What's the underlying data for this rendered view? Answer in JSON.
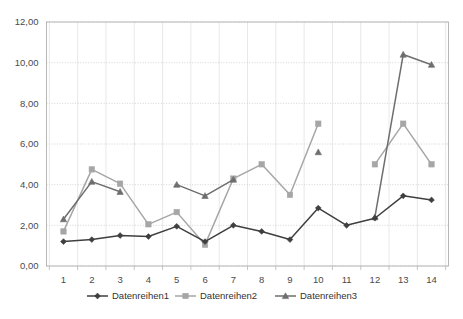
{
  "chart_data": {
    "type": "line",
    "title": "",
    "subtitle": "",
    "xlabel": "",
    "ylabel": "",
    "categories": [
      "1",
      "2",
      "3",
      "4",
      "5",
      "6",
      "7",
      "8",
      "9",
      "10",
      "11",
      "12",
      "13",
      "14"
    ],
    "ylim": [
      0.0,
      12.0
    ],
    "ytick_labels": [
      "0,00",
      "2,00",
      "4,00",
      "6,00",
      "8,00",
      "10,00",
      "12,00"
    ],
    "ytick_values": [
      0.0,
      2.0,
      4.0,
      6.0,
      8.0,
      10.0,
      12.0
    ],
    "grid": true,
    "legend_position": "bottom",
    "series": [
      {
        "name": "Datenreihen1",
        "color": "#3f3f3f",
        "marker": "diamond",
        "values": [
          1.2,
          1.3,
          1.5,
          1.45,
          1.95,
          1.2,
          2.0,
          1.7,
          1.3,
          2.85,
          2.0,
          2.35,
          3.45,
          3.25
        ]
      },
      {
        "name": "Datenreihen2",
        "color": "#a6a6a6",
        "marker": "square",
        "values": [
          1.7,
          4.75,
          4.05,
          2.05,
          2.65,
          1.05,
          4.3,
          5.0,
          3.5,
          7.0,
          null,
          5.0,
          7.0,
          5.0
        ]
      },
      {
        "name": "Datenreihen3",
        "color": "#6e6e6e",
        "marker": "triangle",
        "values": [
          2.3,
          4.15,
          3.65,
          null,
          4.0,
          3.45,
          4.25,
          null,
          null,
          5.6,
          null,
          2.4,
          10.4,
          9.9
        ]
      }
    ]
  },
  "legend": {
    "items": [
      {
        "label": "Datenreihen1",
        "color": "#3f3f3f",
        "marker": "diamond"
      },
      {
        "label": "Datenreihen2",
        "color": "#a6a6a6",
        "marker": "square"
      },
      {
        "label": "Datenreihen3",
        "color": "#6e6e6e",
        "marker": "triangle"
      }
    ]
  }
}
